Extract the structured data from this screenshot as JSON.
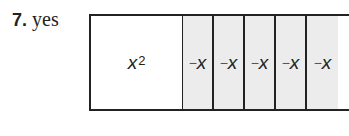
{
  "problem": {
    "number": "7.",
    "answer": "yes"
  },
  "tile_model": {
    "square_tile": {
      "base": "x",
      "exponent": "2"
    },
    "rect_tiles": [
      {
        "sign": "−",
        "var": "x"
      },
      {
        "sign": "−",
        "var": "x"
      },
      {
        "sign": "−",
        "var": "x"
      },
      {
        "sign": "−",
        "var": "x"
      },
      {
        "sign": "−",
        "var": "x"
      }
    ],
    "colors": {
      "border": "#222222",
      "negative_tile_fill": "#ececec",
      "square_fill": "#ffffff"
    }
  }
}
